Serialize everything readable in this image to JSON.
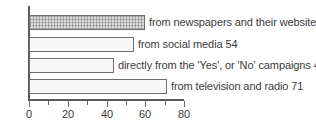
{
  "chart_data": {
    "type": "bar",
    "orientation": "horizontal",
    "title": "",
    "xlabel": "",
    "ylabel": "",
    "xlim": [
      0,
      80
    ],
    "grid": false,
    "legend": "none",
    "axis_ticks": {
      "major": [
        0,
        20,
        40,
        60,
        80
      ],
      "minor": [
        10,
        30,
        50,
        70
      ],
      "labels": [
        "0",
        "20",
        "40",
        "60",
        "80"
      ]
    },
    "categories": [
      "from newspapers and their websites",
      "from social media",
      "directly from the 'Yes', or 'No' campaigns",
      "from television and radio"
    ],
    "values": [
      60,
      54,
      44,
      71
    ],
    "bars": [
      {
        "label": "from newspapers and their websites 60",
        "category": "from newspapers and their websites",
        "value": 60,
        "fill": "#dedede",
        "pattern": "crosshatch",
        "border": "#6e6e6e"
      },
      {
        "label": "from social media 54",
        "category": "from social media",
        "value": 54,
        "fill": "#f7f7f7",
        "pattern": "solid",
        "border": "#6e6e6e"
      },
      {
        "label": "directly from the 'Yes', or 'No' campaigns 44",
        "category": "directly from the 'Yes', or 'No' campaigns",
        "value": 44,
        "fill": "#f7f7f7",
        "pattern": "solid",
        "border": "#6e6e6e"
      },
      {
        "label": "from television and radio 71",
        "category": "from television and radio",
        "value": 71,
        "fill": "#f7f7f7",
        "pattern": "solid",
        "border": "#6e6e6e"
      }
    ],
    "colors": {
      "axis": "#5a5a5a",
      "text": "#3b3b3b",
      "background": "#ffffff",
      "bar_border": "#6e6e6e",
      "bar_fill_plain": "#f7f7f7",
      "bar_fill_hatched": "#dedede"
    }
  }
}
